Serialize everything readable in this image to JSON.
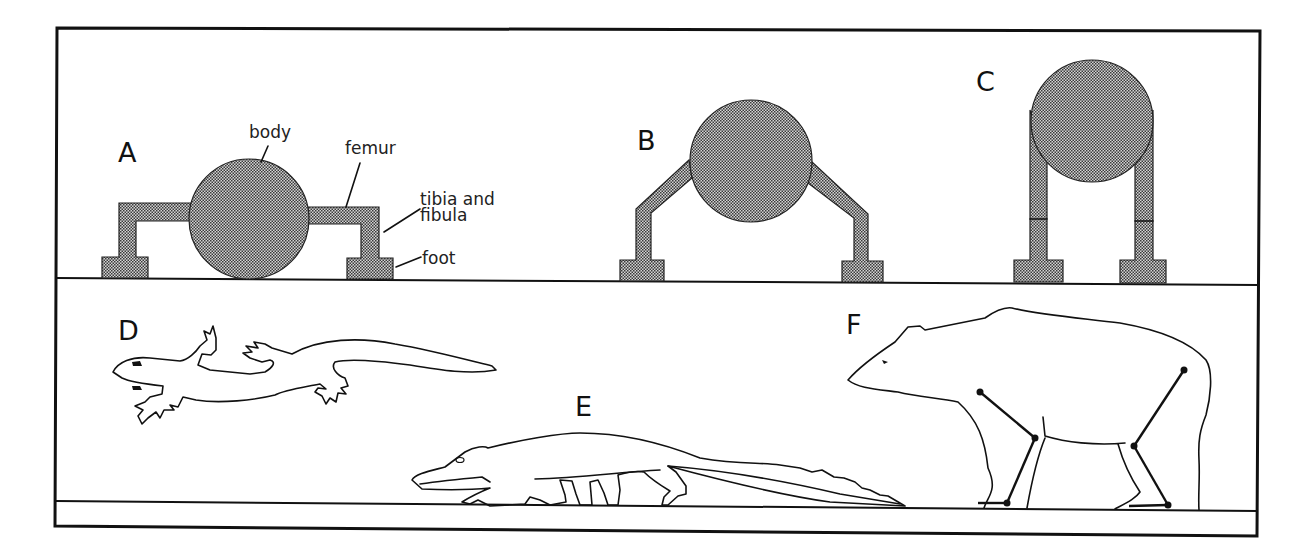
{
  "figure": {
    "panels": [
      {
        "id": "A",
        "label": "A",
        "posture": "sprawling",
        "kind": "schematic"
      },
      {
        "id": "B",
        "label": "B",
        "posture": "semi-erect",
        "kind": "schematic"
      },
      {
        "id": "C",
        "label": "C",
        "posture": "erect",
        "kind": "schematic"
      },
      {
        "id": "D",
        "label": "D",
        "animal": "salamander",
        "kind": "drawing"
      },
      {
        "id": "E",
        "label": "E",
        "animal": "crocodile",
        "kind": "drawing"
      },
      {
        "id": "F",
        "label": "F",
        "animal": "bear",
        "kind": "drawing"
      }
    ],
    "annotations": {
      "body": "body",
      "femur": "femur",
      "tibia_line1": "tibia and",
      "tibia_line2": "fibula",
      "foot": "foot"
    },
    "colors": {
      "ink": "#111111",
      "stipple_fill": "#9a9a9a",
      "background": "#ffffff"
    }
  }
}
